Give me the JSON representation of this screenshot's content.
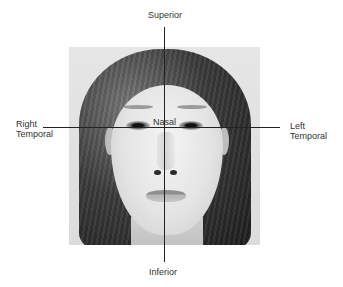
{
  "diagram": {
    "type": "face-orientation-axes",
    "labels": {
      "superior": "Superior",
      "inferior": "Inferior",
      "nasal": "Nasal",
      "right_temporal_line1": "Right",
      "right_temporal_line2": "Temporal",
      "left_temporal_line1": "Left",
      "left_temporal_line2": "Temporal"
    },
    "image": {
      "subject": "front-facing grayscale portrait of a woman"
    },
    "axes": {
      "vertical": {
        "from": "Superior",
        "to": "Inferior"
      },
      "horizontal": {
        "from": "Right Temporal",
        "to": "Left Temporal"
      }
    },
    "colors": {
      "line": "#222222",
      "text": "#333333",
      "background": "#ffffff"
    }
  }
}
